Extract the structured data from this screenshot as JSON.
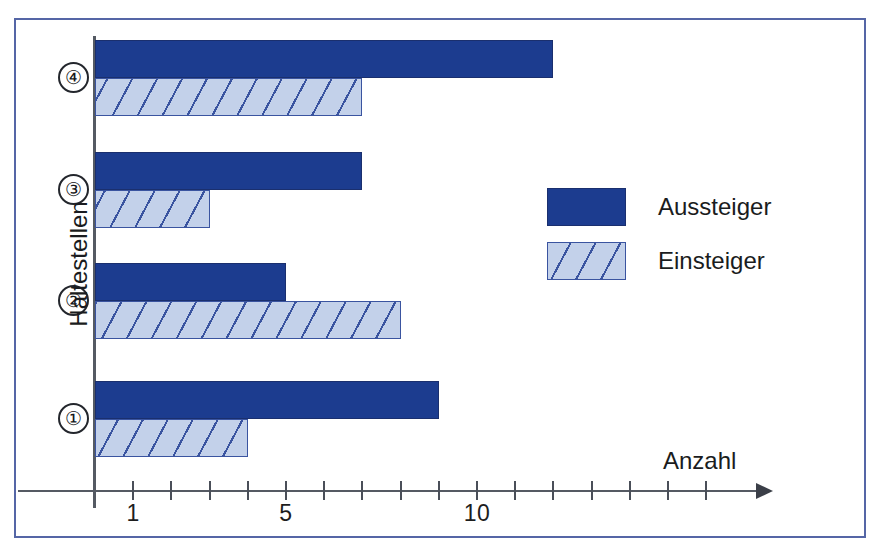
{
  "chart_data": {
    "type": "bar",
    "orientation": "horizontal",
    "title": "",
    "xlabel": "Anzahl",
    "ylabel": "Haltestellen",
    "categories": [
      "1",
      "2",
      "3",
      "4"
    ],
    "category_display": [
      "①",
      "②",
      "③",
      "④"
    ],
    "series": [
      {
        "name": "Aussteiger",
        "values": [
          9,
          5,
          7,
          12
        ],
        "color": "#1c3c8f",
        "fill": "solid"
      },
      {
        "name": "Einsteiger",
        "values": [
          4,
          8,
          3,
          7
        ],
        "color": "#c3d1ea",
        "fill": "hatched"
      }
    ],
    "xlim": [
      0,
      17
    ],
    "xticks": [
      1,
      2,
      3,
      4,
      5,
      6,
      7,
      8,
      9,
      10,
      11,
      12,
      13,
      14,
      15,
      16
    ],
    "xtick_labels_shown": [
      {
        "value": 1,
        "label": "1"
      },
      {
        "value": 5,
        "label": "5"
      },
      {
        "value": 10,
        "label": "10"
      }
    ],
    "grid": false,
    "legend_position": "right-middle",
    "axis_arrow": true
  },
  "axes": {
    "x_title": "Anzahl",
    "y_title": "Haltestellen"
  },
  "legend": {
    "items": [
      {
        "label": "Aussteiger",
        "swatch": "solid-dark-blue"
      },
      {
        "label": "Einsteiger",
        "swatch": "hatched-light-blue"
      }
    ]
  },
  "colors": {
    "dark_blue": "#1c3c8f",
    "light_blue": "#c3d1ea",
    "hatch_line": "#3a54a0",
    "frame": "#5566a6",
    "axis": "#555a63",
    "text": "#1a1c20"
  }
}
